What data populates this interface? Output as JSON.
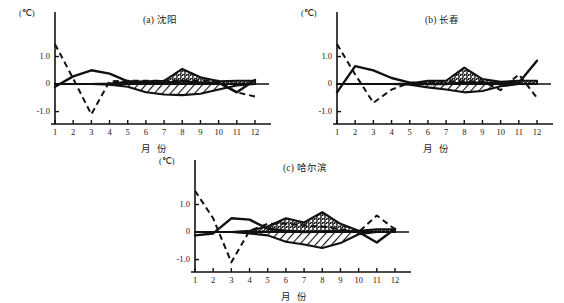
{
  "figure": {
    "background": "#ffffff",
    "ink": "#111111",
    "axis_unit": "(℃)",
    "xaxis_label": "月 份",
    "yticks": [
      "1.0",
      "0",
      "-1.0"
    ],
    "xticks": [
      "1",
      "2",
      "3",
      "4",
      "5",
      "6",
      "7",
      "8",
      "9",
      "10",
      "11",
      "12"
    ]
  },
  "chart_data": [
    {
      "type": "line",
      "panel": "a",
      "title": "(a) 沈阳",
      "xlabel": "月 份",
      "ylabel": "(℃)",
      "xlim": [
        1,
        12
      ],
      "ylim": [
        -1.45,
        1.6
      ],
      "yticks": [
        1.0,
        0,
        -1.0
      ],
      "xticks": [
        1,
        2,
        3,
        4,
        5,
        6,
        7,
        8,
        9,
        10,
        11,
        12
      ],
      "grid": false,
      "legend": "none",
      "x": [
        1,
        2,
        3,
        4,
        5,
        6,
        7,
        8,
        9,
        10,
        11,
        12
      ],
      "series": [
        {
          "name": "dashed-series",
          "style": "dashed",
          "values": [
            1.45,
            0.2,
            -1.1,
            0.1,
            0.12,
            0.12,
            0.12,
            0.12,
            0.12,
            0.12,
            -0.3,
            -0.45
          ]
        },
        {
          "name": "solid-series",
          "style": "solid",
          "values": [
            -0.1,
            0.28,
            0.5,
            0.38,
            0.1,
            0.05,
            0.05,
            0.1,
            0.05,
            0.05,
            -0.3,
            0.15
          ]
        },
        {
          "name": "band-upper-stippled",
          "style": "fill-stipple",
          "values": [
            0.0,
            0.0,
            0.0,
            0.02,
            0.08,
            0.1,
            0.12,
            0.55,
            0.25,
            0.1,
            0.12,
            0.12
          ]
        },
        {
          "name": "band-lower-hatched",
          "style": "fill-hatch",
          "values": [
            0.0,
            0.0,
            0.0,
            -0.02,
            -0.1,
            -0.3,
            -0.38,
            -0.4,
            -0.35,
            -0.2,
            -0.05,
            0.0
          ]
        }
      ]
    },
    {
      "type": "line",
      "panel": "b",
      "title": "(b) 长春",
      "xlabel": "月 份",
      "ylabel": "(℃)",
      "xlim": [
        1,
        12
      ],
      "ylim": [
        -1.45,
        1.6
      ],
      "yticks": [
        1.0,
        0,
        -1.0
      ],
      "xticks": [
        1,
        2,
        3,
        4,
        5,
        6,
        7,
        8,
        9,
        10,
        11,
        12
      ],
      "grid": false,
      "legend": "none",
      "x": [
        1,
        2,
        3,
        4,
        5,
        6,
        7,
        8,
        9,
        10,
        11,
        12
      ],
      "series": [
        {
          "name": "dashed-series",
          "style": "dashed",
          "values": [
            1.45,
            0.35,
            -0.68,
            -0.2,
            0.05,
            0.08,
            0.1,
            0.1,
            0.1,
            -0.22,
            0.35,
            -0.5
          ]
        },
        {
          "name": "solid-series",
          "style": "solid",
          "values": [
            -0.3,
            0.65,
            0.5,
            0.22,
            0.05,
            0.0,
            0.0,
            0.05,
            0.05,
            0.02,
            0.05,
            0.85
          ]
        },
        {
          "name": "band-upper-stippled",
          "style": "fill-stipple",
          "values": [
            0.0,
            0.0,
            0.0,
            0.0,
            0.02,
            0.12,
            0.12,
            0.6,
            0.18,
            0.08,
            0.12,
            0.12
          ]
        },
        {
          "name": "band-lower-hatched",
          "style": "fill-hatch",
          "values": [
            0.0,
            0.0,
            0.0,
            0.0,
            -0.02,
            -0.12,
            -0.2,
            -0.3,
            -0.25,
            -0.08,
            0.0,
            0.0
          ]
        }
      ]
    },
    {
      "type": "line",
      "panel": "c",
      "title": "(c) 哈尔滨",
      "xlabel": "月 份",
      "ylabel": "(℃)",
      "xlim": [
        1,
        12
      ],
      "ylim": [
        -1.45,
        1.6
      ],
      "yticks": [
        1.0,
        0,
        -1.0
      ],
      "xticks": [
        1,
        2,
        3,
        4,
        5,
        6,
        7,
        8,
        9,
        10,
        11,
        12
      ],
      "grid": false,
      "legend": "none",
      "x": [
        1,
        2,
        3,
        4,
        5,
        6,
        7,
        8,
        9,
        10,
        11,
        12
      ],
      "series": [
        {
          "name": "dashed-series",
          "style": "dashed",
          "values": [
            1.5,
            0.5,
            -1.1,
            0.05,
            0.3,
            0.3,
            0.25,
            0.2,
            0.1,
            0.0,
            0.6,
            0.1
          ]
        },
        {
          "name": "solid-series",
          "style": "solid",
          "values": [
            -0.12,
            -0.05,
            0.5,
            0.45,
            0.12,
            0.05,
            0.0,
            0.02,
            0.05,
            0.0,
            -0.38,
            0.12
          ]
        },
        {
          "name": "band-upper-stippled",
          "style": "fill-stipple",
          "values": [
            0.0,
            0.0,
            0.0,
            0.05,
            0.2,
            0.5,
            0.35,
            0.72,
            0.3,
            0.05,
            0.1,
            0.1
          ]
        },
        {
          "name": "band-lower-hatched",
          "style": "fill-hatch",
          "values": [
            0.0,
            0.0,
            0.0,
            -0.05,
            -0.12,
            -0.35,
            -0.45,
            -0.58,
            -0.4,
            -0.08,
            0.0,
            0.0
          ]
        }
      ]
    }
  ]
}
